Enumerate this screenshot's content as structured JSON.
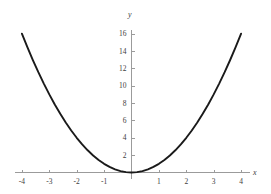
{
  "chart_data": {
    "type": "line",
    "title": "",
    "subtitle": "",
    "xlabel": "x",
    "ylabel": "y",
    "xlim": [
      -4.35,
      4.6
    ],
    "ylim": [
      -1.2,
      17.2
    ],
    "grid": false,
    "legend": null,
    "annotations": [],
    "xticks": [
      -4,
      -3,
      -2,
      -1,
      1,
      2,
      3,
      4
    ],
    "xtick_labels": [
      "-4",
      "-3",
      "-2",
      "-1",
      "1",
      "2",
      "3",
      "4"
    ],
    "yticks": [
      2,
      4,
      6,
      8,
      10,
      12,
      14,
      16
    ],
    "ytick_labels": [
      "2",
      "4",
      "6",
      "8",
      "10",
      "12",
      "14",
      "16"
    ],
    "series": [
      {
        "name": "y = x^2",
        "color": "#1a1a1a",
        "x": [
          -4,
          -3.8,
          -3.6,
          -3.4,
          -3.2,
          -3,
          -2.8,
          -2.6,
          -2.4,
          -2.2,
          -2,
          -1.8,
          -1.6,
          -1.4,
          -1.2,
          -1,
          -0.8,
          -0.6,
          -0.4,
          -0.2,
          0,
          0.2,
          0.4,
          0.6,
          0.8,
          1,
          1.2,
          1.4,
          1.6,
          1.8,
          2,
          2.2,
          2.4,
          2.6,
          2.8,
          3,
          3.2,
          3.4,
          3.6,
          3.8,
          4
        ],
        "values": [
          16,
          14.44,
          12.96,
          11.56,
          10.24,
          9,
          7.84,
          6.76,
          5.76,
          4.84,
          4,
          3.24,
          2.56,
          1.96,
          1.44,
          1,
          0.64,
          0.36,
          0.16,
          0.04,
          0,
          0.04,
          0.16,
          0.36,
          0.64,
          1,
          1.44,
          1.96,
          2.56,
          3.24,
          4,
          4.84,
          5.76,
          6.76,
          7.84,
          9,
          10.24,
          11.56,
          12.96,
          14.44,
          16
        ]
      }
    ],
    "axis_color": "#9b9b9b",
    "background_color": "#ffffff"
  }
}
